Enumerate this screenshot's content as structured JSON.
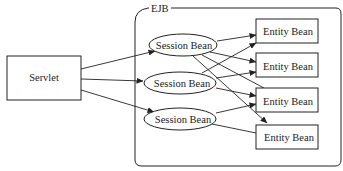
{
  "diagram": {
    "container": {
      "label": "EJB"
    },
    "servlet": {
      "label": "Servlet"
    },
    "session_beans": [
      {
        "id": "s1",
        "label": "Session Bean"
      },
      {
        "id": "s2",
        "label": "Session Bean"
      },
      {
        "id": "s3",
        "label": "Session Bean"
      }
    ],
    "entity_beans": [
      {
        "id": "e1",
        "label": "Entity Bean"
      },
      {
        "id": "e2",
        "label": "Entity Bean"
      },
      {
        "id": "e3",
        "label": "Entity Bean"
      },
      {
        "id": "e4",
        "label": "Entity Bean"
      }
    ],
    "edges": [
      {
        "from": "servlet",
        "to": "s1"
      },
      {
        "from": "servlet",
        "to": "s2"
      },
      {
        "from": "servlet",
        "to": "s3"
      },
      {
        "from": "s1",
        "to": "e1"
      },
      {
        "from": "s1",
        "to": "e2"
      },
      {
        "from": "s1",
        "to": "e3"
      },
      {
        "from": "s1",
        "to": "e4"
      },
      {
        "from": "s2",
        "to": "e1"
      },
      {
        "from": "s2",
        "to": "e2"
      },
      {
        "from": "s2",
        "to": "e3"
      },
      {
        "from": "s3",
        "to": "e3"
      },
      {
        "from": "s3",
        "to": "e4"
      }
    ],
    "colors": {
      "stroke": "#222222",
      "background": "#ffffff"
    }
  }
}
